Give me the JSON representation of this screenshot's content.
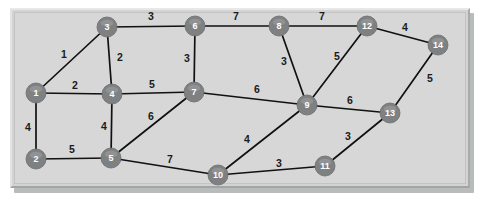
{
  "figure": {
    "kind": "weighted-undirected-graph",
    "panel_background": "#d6d7d6",
    "node_color": "#7e8081",
    "node_label_color": "#ffffff",
    "edge_color": "#111111",
    "weight_label_color": "#1a1a1a"
  },
  "chart_data": {
    "type": "diagram",
    "title": "",
    "xlabel": "",
    "ylabel": "",
    "nodes": [
      {
        "id": "1",
        "label": "1",
        "x": 36,
        "y": 93
      },
      {
        "id": "2",
        "label": "2",
        "x": 36,
        "y": 159
      },
      {
        "id": "3",
        "label": "3",
        "x": 107,
        "y": 27
      },
      {
        "id": "4",
        "label": "4",
        "x": 112,
        "y": 94
      },
      {
        "id": "5",
        "label": "5",
        "x": 111,
        "y": 158
      },
      {
        "id": "6",
        "label": "6",
        "x": 195,
        "y": 26
      },
      {
        "id": "7",
        "label": "7",
        "x": 194,
        "y": 92
      },
      {
        "id": "8",
        "label": "8",
        "x": 279,
        "y": 26
      },
      {
        "id": "9",
        "label": "9",
        "x": 307,
        "y": 105
      },
      {
        "id": "10",
        "label": "10",
        "x": 218,
        "y": 175
      },
      {
        "id": "11",
        "label": "11",
        "x": 325,
        "y": 166
      },
      {
        "id": "12",
        "label": "12",
        "x": 367,
        "y": 26
      },
      {
        "id": "13",
        "label": "13",
        "x": 390,
        "y": 113
      },
      {
        "id": "14",
        "label": "14",
        "x": 438,
        "y": 45
      }
    ],
    "node_radius": 10,
    "edges": [
      {
        "from": "1",
        "to": "3",
        "weight": 1,
        "label_x": 64,
        "label_y": 55
      },
      {
        "from": "1",
        "to": "4",
        "weight": 2,
        "label_x": 75,
        "label_y": 86
      },
      {
        "from": "1",
        "to": "2",
        "weight": 4,
        "label_x": 28,
        "label_y": 128
      },
      {
        "from": "3",
        "to": "4",
        "weight": 2,
        "label_x": 120,
        "label_y": 58
      },
      {
        "from": "3",
        "to": "6",
        "weight": 3,
        "label_x": 151,
        "label_y": 17
      },
      {
        "from": "2",
        "to": "5",
        "weight": 5,
        "label_x": 72,
        "label_y": 150
      },
      {
        "from": "4",
        "to": "5",
        "weight": 4,
        "label_x": 104,
        "label_y": 127
      },
      {
        "from": "4",
        "to": "7",
        "weight": 5,
        "label_x": 152,
        "label_y": 85
      },
      {
        "from": "5",
        "to": "7",
        "weight": 6,
        "label_x": 151,
        "label_y": 117
      },
      {
        "from": "5",
        "to": "10",
        "weight": 7,
        "label_x": 170,
        "label_y": 160
      },
      {
        "from": "6",
        "to": "7",
        "weight": 3,
        "label_x": 187,
        "label_y": 59
      },
      {
        "from": "6",
        "to": "8",
        "weight": 7,
        "label_x": 236,
        "label_y": 17
      },
      {
        "from": "7",
        "to": "9",
        "weight": 6,
        "label_x": 257,
        "label_y": 90
      },
      {
        "from": "8",
        "to": "9",
        "weight": 3,
        "label_x": 284,
        "label_y": 62
      },
      {
        "from": "8",
        "to": "12",
        "weight": 7,
        "label_x": 322,
        "label_y": 17
      },
      {
        "from": "9",
        "to": "12",
        "weight": 5,
        "label_x": 337,
        "label_y": 57
      },
      {
        "from": "9",
        "to": "10",
        "weight": 4,
        "label_x": 247,
        "label_y": 140
      },
      {
        "from": "9",
        "to": "13",
        "weight": 6,
        "label_x": 350,
        "label_y": 101
      },
      {
        "from": "10",
        "to": "11",
        "weight": 3,
        "label_x": 279,
        "label_y": 164
      },
      {
        "from": "11",
        "to": "13",
        "weight": 3,
        "label_x": 348,
        "label_y": 137
      },
      {
        "from": "12",
        "to": "14",
        "weight": 4,
        "label_x": 405,
        "label_y": 28
      },
      {
        "from": "13",
        "to": "14",
        "weight": 5,
        "label_x": 430,
        "label_y": 79
      }
    ]
  }
}
